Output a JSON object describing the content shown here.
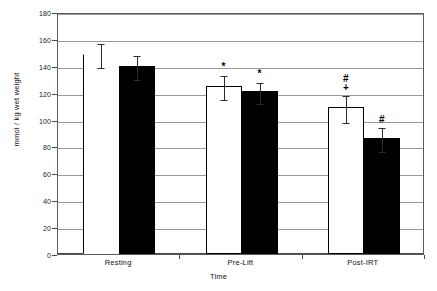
{
  "chart_data": {
    "type": "bar",
    "title": "",
    "xlabel": "Time",
    "ylabel": "mmol / kg wet weight",
    "categories": [
      "Resting",
      "Pre-Lift",
      "Post-IRT"
    ],
    "ylim": [
      0,
      180
    ],
    "ytick_step": 20,
    "yticks": [
      0,
      20,
      40,
      60,
      80,
      100,
      120,
      140,
      160,
      180
    ],
    "ytick_labels": [
      "0",
      "20",
      "40",
      "60",
      "80",
      "100",
      "120",
      "140",
      "160",
      "180"
    ],
    "grid": true,
    "legend": "none",
    "series": [
      {
        "name": "white-bars",
        "fill": "#ffffff",
        "edge": "#000000",
        "values": [
          149,
          125,
          109
        ],
        "errors": [
          9,
          9,
          10
        ],
        "annotations": [
          "",
          "*",
          "#\n+"
        ]
      },
      {
        "name": "black-bars",
        "fill": "#000000",
        "edge": "#000000",
        "values": [
          140,
          121,
          86
        ],
        "errors": [
          9,
          8,
          9
        ],
        "annotations": [
          "",
          "*",
          "#"
        ]
      }
    ]
  },
  "colors": {
    "grid": "#9a9a9a",
    "axis": "#4a4a4a",
    "frame": "#5a5a5a",
    "text": "#111111",
    "bar_white": "#ffffff",
    "bar_black": "#000000",
    "error": "#2b2b2b"
  }
}
